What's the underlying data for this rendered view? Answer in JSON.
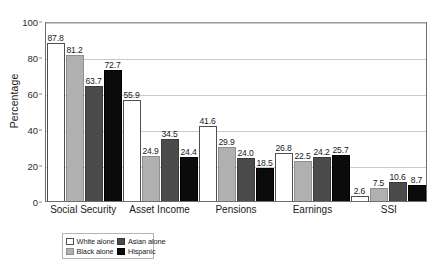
{
  "chart_data": {
    "type": "bar",
    "title": "",
    "subtitle": "",
    "xlabel": "",
    "ylabel": "Percentage",
    "ylim": [
      0,
      100
    ],
    "ytick_step": 20,
    "ytick_labels": [
      "0",
      "20",
      "40",
      "60",
      "80",
      "100"
    ],
    "grid": "horizontal",
    "legend_position": "bottom-left",
    "grouping": "grouped",
    "categories": [
      "Social Security",
      "Asset Income",
      "Pensions",
      "Earnings",
      "SSI"
    ],
    "series": [
      {
        "name": "White alone",
        "color": "#ffffff",
        "swatch": "w",
        "values": [
          87.8,
          55.9,
          41.6,
          26.8,
          2.6
        ],
        "labels": [
          "87.8",
          "55.9",
          "41.6",
          "26.8",
          "2.6"
        ]
      },
      {
        "name": "Black alone",
        "color": "#b0b0b0",
        "swatch": "lg",
        "values": [
          81.2,
          24.9,
          29.9,
          22.5,
          7.5
        ],
        "labels": [
          "81.2",
          "24.9",
          "29.9",
          "22.5",
          "7.5"
        ]
      },
      {
        "name": "Asian alone",
        "color": "#4b4b4b",
        "swatch": "dg",
        "values": [
          63.7,
          34.5,
          24.0,
          24.2,
          10.6
        ],
        "labels": [
          "63.7",
          "34.5",
          "24.0",
          "24.2",
          "10.6"
        ]
      },
      {
        "name": "Hispanic",
        "color": "#0b0b0b",
        "swatch": "bk",
        "values": [
          72.7,
          24.4,
          18.5,
          25.7,
          8.7
        ],
        "labels": [
          "72.7",
          "24.4",
          "18.5",
          "25.7",
          "8.7"
        ]
      }
    ]
  },
  "legend": {
    "entries": [
      {
        "label": "White alone",
        "swatch": "w"
      },
      {
        "label": "Asian alone",
        "swatch": "dg"
      },
      {
        "label": "Black alone",
        "swatch": "lg"
      },
      {
        "label": "Hispanic",
        "swatch": "bk"
      }
    ]
  },
  "axis": {
    "y_title": "Percentage",
    "y_ticks": [
      "100",
      "80",
      "60",
      "40",
      "20",
      "0"
    ]
  }
}
